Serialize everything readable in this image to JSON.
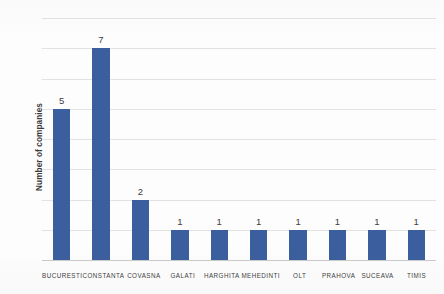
{
  "chart_data": {
    "type": "bar",
    "title": "",
    "xlabel": "",
    "ylabel": "Number of companies",
    "categories": [
      "BUCURESTI",
      "CONSTANTA",
      "COVASNA",
      "GALATI",
      "HARGHITA",
      "MEHEDINTI",
      "OLT",
      "PRAHOVA",
      "SUCEAVA",
      "TIMIS"
    ],
    "values": [
      5,
      7,
      2,
      1,
      1,
      1,
      1,
      1,
      1,
      1
    ],
    "value_labels": [
      "5",
      "7",
      "2",
      "1",
      "1",
      "1",
      "1",
      "1",
      "1",
      "1"
    ],
    "ylim": [
      0,
      8
    ],
    "ytick_step": 1,
    "ytick_labels": [
      "8",
      "7",
      "6",
      "5",
      "4",
      "3",
      "2",
      "1",
      "0"
    ],
    "ytick_values": [
      8,
      7,
      6,
      5,
      4,
      3,
      2,
      1,
      0
    ],
    "grid": true,
    "grid_axis": "y",
    "legend": false,
    "legend_position": "none",
    "bar_color": "#3b5e9e",
    "grid_color": "#e2e2e2",
    "axis_color": "#c9c9c9",
    "background_color": "#fdfdfd",
    "text_color": "#404040"
  }
}
